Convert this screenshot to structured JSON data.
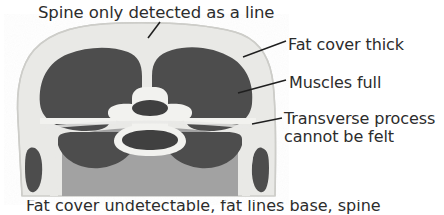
{
  "figure": {
    "type": "anatomical-cross-section",
    "title": "Spine only detected as a line",
    "modality": "line-drawing cross-section",
    "colors": {
      "background": "#ffffff",
      "fat_layer": "#e9e9e6",
      "muscle": "#4d4d4d",
      "bone": "#f2f2ef",
      "viscera": "#a2a2a2",
      "outline": "#cfcfcb",
      "text": "#2c2c2c",
      "leader_line": "#1f1f1f"
    },
    "regions": [
      {
        "name": "fat-cover-layer",
        "tone": "light-gray",
        "label_ref": "Fat cover thick"
      },
      {
        "name": "epaxial-muscle-left",
        "tone": "dark-gray",
        "label_ref": "Muscles full"
      },
      {
        "name": "epaxial-muscle-right",
        "tone": "dark-gray",
        "label_ref": "Muscles full"
      },
      {
        "name": "vertebra-body",
        "tone": "bone-white",
        "label_ref": "Transverse process cannot be felt"
      },
      {
        "name": "spinous-process",
        "tone": "dark-gray",
        "label_ref": "Spine only detected as a line"
      },
      {
        "name": "vertebral-canal",
        "tone": "dark-gray",
        "label_ref": ""
      },
      {
        "name": "abdominal-viscera",
        "tone": "mid-gray",
        "label_ref": ""
      }
    ]
  },
  "annotations": {
    "title": {
      "text": "Spine only detected as a line",
      "leader": true
    },
    "items": [
      {
        "id": "fat-cover",
        "text": "Fat cover thick",
        "lines": [
          "Fat cover thick"
        ],
        "leader": true
      },
      {
        "id": "muscles-full",
        "text": "Muscles full",
        "lines": [
          "Muscles full"
        ],
        "leader": true
      },
      {
        "id": "transverse-process",
        "text": "Transverse process cannot be felt",
        "lines": [
          "Transverse process",
          "cannot be felt"
        ],
        "leader": true
      }
    ]
  },
  "caption": {
    "text": "Fat cover undetectable, fat lines base, spine",
    "visible": "partially-cropped"
  }
}
